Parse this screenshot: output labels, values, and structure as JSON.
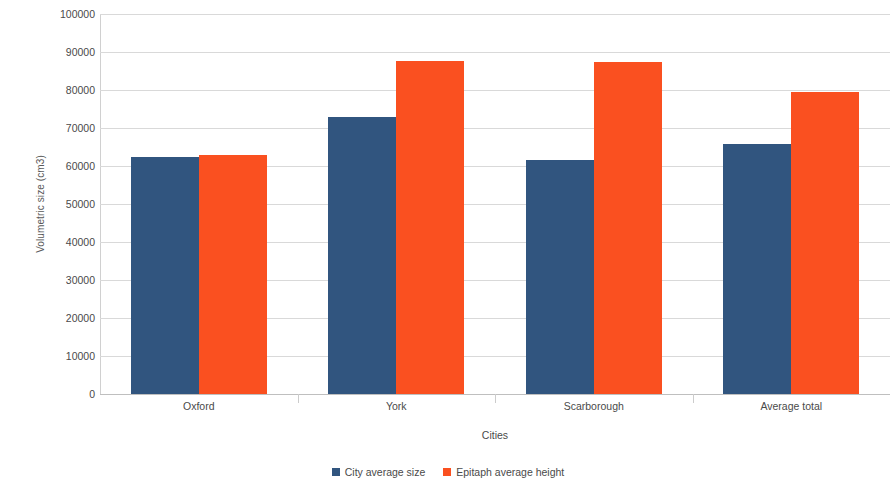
{
  "chart_data": {
    "type": "bar",
    "title": "",
    "xlabel": "Cities",
    "ylabel": "Volumetric size (cm3)",
    "categories": [
      "Oxford",
      "York",
      "Scarborough",
      "Average total"
    ],
    "series": [
      {
        "name": "City average size",
        "color": "#31557f",
        "values": [
          62400,
          72900,
          61500,
          65800
        ]
      },
      {
        "name": "Epitaph average height",
        "color": "#fa5020",
        "values": [
          63000,
          87600,
          87400,
          79400
        ]
      }
    ],
    "ylim": [
      0,
      100000
    ],
    "ytick_labels": [
      "0",
      "10000",
      "20000",
      "30000",
      "40000",
      "50000",
      "60000",
      "70000",
      "80000",
      "90000",
      "100000"
    ],
    "ytick_values": [
      0,
      10000,
      20000,
      30000,
      40000,
      50000,
      60000,
      70000,
      80000,
      90000,
      100000
    ],
    "grid": true,
    "legend_position": "bottom"
  }
}
